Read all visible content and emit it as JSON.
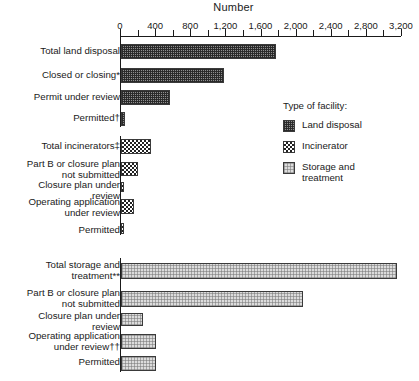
{
  "chart_data": {
    "type": "bar",
    "orientation": "horizontal",
    "title": "Number",
    "xlabel": "Number",
    "ylabel": "",
    "xlim": [
      0,
      3200
    ],
    "grid": false,
    "legend_position": "right",
    "tick_labels": [
      "0",
      "400",
      "800",
      "1,200",
      "1,600",
      "2,000",
      "2,400",
      "2,800",
      "3,200"
    ],
    "tick_values": [
      0,
      400,
      800,
      1200,
      1600,
      2000,
      2400,
      2800,
      3200
    ],
    "minor_tick_step": 200,
    "legend_title": "Type of facility:",
    "series": [
      {
        "name": "Land disposal",
        "pattern": "dense-cross-hatch-dark",
        "color": "#8e8e8e",
        "categories": [
          "Total land disposal",
          "Closed or closing*",
          "Permit under review",
          "Permitted†"
        ],
        "values": [
          1770,
          1175,
          555,
          40
        ]
      },
      {
        "name": "Incinerator",
        "pattern": "checkerboard",
        "color": "#222222",
        "categories": [
          "Total incinerators‡",
          "Part B or closure plan\nnot submitted",
          "Closure plan under\nreview",
          "Operating application\nunder review",
          "Permitted"
        ],
        "values": [
          345,
          195,
          25,
          150,
          20
        ]
      },
      {
        "name": "Storage and\ntreatment",
        "pattern": "light-stipple",
        "color": "#dcdcdc",
        "categories": [
          "Total storage and\ntreatment**",
          "Part B or closure plan\nnot submitted",
          "Closure plan under\nreview",
          "Operating application\nunder review††",
          "Permitted"
        ],
        "values": [
          3140,
          2070,
          245,
          400,
          400
        ]
      }
    ]
  },
  "legend": {
    "title": "Type of facility:",
    "items": [
      {
        "label": "Land disposal"
      },
      {
        "label": "Incinerator"
      },
      {
        "label": "Storage and\ntreatment"
      }
    ]
  }
}
